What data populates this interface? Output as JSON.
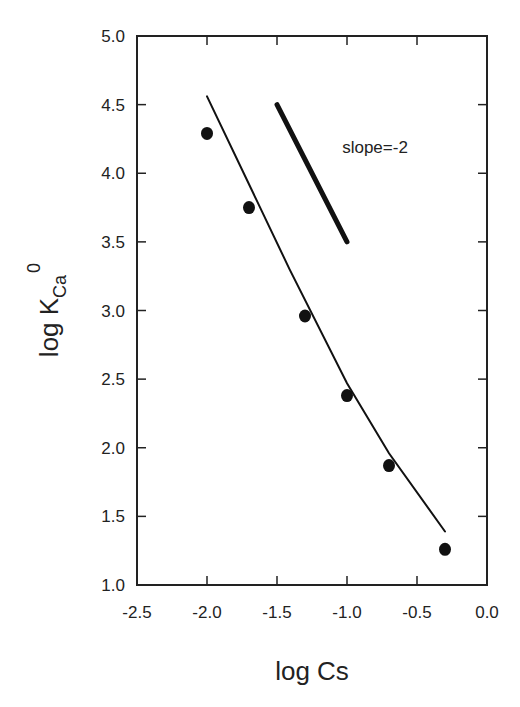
{
  "chart_data": {
    "type": "scatter",
    "title": "",
    "xlabel": "log Cs",
    "ylabel": "log K",
    "ylabel_subscript": "Ca",
    "ylabel_superscript": "0",
    "xlim": [
      -2.5,
      0.0
    ],
    "ylim": [
      1.0,
      5.0
    ],
    "xticks": [
      -2.5,
      -2.0,
      -1.5,
      -1.0,
      -0.5,
      0.0
    ],
    "xtick_labels": [
      "-2.5",
      "-2.0",
      "-1.5",
      "-1.0",
      "-0.5",
      "0.0"
    ],
    "yticks": [
      1.0,
      1.5,
      2.0,
      2.5,
      3.0,
      3.5,
      4.0,
      4.5,
      5.0
    ],
    "ytick_labels": [
      "1.0",
      "1.5",
      "2.0",
      "2.5",
      "3.0",
      "3.5",
      "4.0",
      "4.5",
      "5.0"
    ],
    "grid": false,
    "legend": null,
    "series": [
      {
        "name": "measured",
        "type": "scatter",
        "marker": "filled-circle",
        "x": [
          -2.0,
          -1.7,
          -1.3,
          -1.0,
          -0.7,
          -0.3
        ],
        "y": [
          4.29,
          3.75,
          2.96,
          2.38,
          1.87,
          1.26
        ]
      },
      {
        "name": "fit",
        "type": "line",
        "x": [
          -2.0,
          -1.7,
          -1.41,
          -1.0,
          -0.7,
          -0.3
        ],
        "y": [
          4.56,
          3.92,
          3.3,
          2.47,
          1.96,
          1.39
        ]
      },
      {
        "name": "slope reference",
        "type": "line",
        "style": "thick",
        "x": [
          -1.5,
          -1.0
        ],
        "y": [
          4.5,
          3.5
        ]
      }
    ],
    "annotations": [
      {
        "text": "slope=-2",
        "x": -0.8,
        "y": 4.15
      }
    ]
  }
}
